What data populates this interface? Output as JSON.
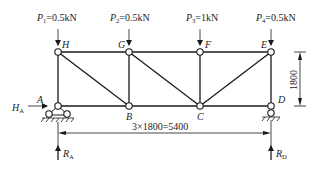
{
  "diagram": {
    "type": "plane truss",
    "loads": [
      {
        "name": "P",
        "sub": "1",
        "value": "=0.5kN",
        "node": "H"
      },
      {
        "name": "P",
        "sub": "2",
        "value": "=0.5kN",
        "node": "G"
      },
      {
        "name": "P",
        "sub": "3",
        "value": "=1kN",
        "node": "F"
      },
      {
        "name": "P",
        "sub": "4",
        "value": "=0.5kN",
        "node": "E"
      }
    ],
    "nodes": {
      "top": [
        "H",
        "G",
        "F",
        "E"
      ],
      "bottom": [
        "A",
        "B",
        "C",
        "D"
      ]
    },
    "members": [
      "H-G",
      "G-F",
      "F-E",
      "A-B",
      "B-C",
      "C-D",
      "A-H",
      "B-G",
      "C-F",
      "D-E",
      "H-B",
      "G-C",
      "E-C"
    ],
    "supports": {
      "A": "pin",
      "D": "roller"
    },
    "reactions": [
      {
        "name": "H",
        "sub": "A"
      },
      {
        "name": "R",
        "sub": "A"
      },
      {
        "name": "R",
        "sub": "D"
      }
    ],
    "dimensions": {
      "span": "3×1800=5400",
      "height": "1800"
    }
  }
}
